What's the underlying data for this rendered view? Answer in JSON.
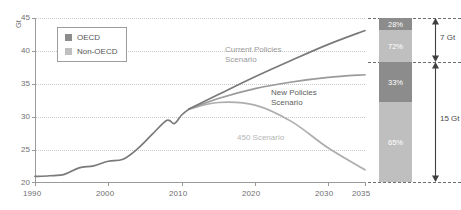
{
  "chart_data": {
    "type": "line",
    "title": "",
    "xlabel": "",
    "ylabel": "Gt",
    "yunit": "Gt",
    "xlim": [
      1990,
      2035
    ],
    "ylim": [
      20,
      45
    ],
    "grid": true,
    "xticks": [
      "1990",
      "2000",
      "2010",
      "2020",
      "2030",
      "2035"
    ],
    "xtick_values": [
      1990,
      2000,
      2010,
      2020,
      2030,
      2035
    ],
    "yticks": [
      "20",
      "25",
      "30",
      "35",
      "40",
      "45"
    ],
    "ytick_values": [
      20,
      25,
      30,
      35,
      40,
      45
    ],
    "legend": {
      "position": "top-left",
      "entries": [
        {
          "label": "OECD",
          "color": "#8c8c8c"
        },
        {
          "label": "Non-OECD",
          "color": "#bfbfbf"
        }
      ]
    },
    "series": [
      {
        "name": "Historical",
        "color": "#7a7a7a",
        "x": [
          1990,
          1992,
          1994,
          1996,
          1998,
          2000,
          2002,
          2004,
          2006,
          2008,
          2009,
          2010,
          2011
        ],
        "values": [
          21.0,
          21.1,
          21.3,
          22.3,
          22.6,
          23.3,
          23.6,
          25.2,
          27.4,
          29.5,
          29.0,
          30.3,
          31.2
        ]
      },
      {
        "name": "Current Policies Scenario",
        "color": "#7a7a7a",
        "x": [
          2011,
          2015,
          2020,
          2025,
          2030,
          2035
        ],
        "values": [
          31.2,
          33.4,
          36.1,
          38.6,
          41.0,
          43.1
        ]
      },
      {
        "name": "New Policies Scenario",
        "color": "#9a9a9a",
        "x": [
          2011,
          2015,
          2020,
          2025,
          2030,
          2035
        ],
        "values": [
          31.2,
          32.8,
          34.3,
          35.3,
          36.0,
          36.4
        ]
      },
      {
        "name": "450 Scenario",
        "color": "#adadad",
        "x": [
          2011,
          2015,
          2020,
          2025,
          2030,
          2035
        ],
        "values": [
          31.2,
          32.2,
          31.8,
          29.3,
          25.3,
          22.0
        ]
      }
    ],
    "annotations": [
      {
        "text": "Current Policies",
        "text2": "Scenario",
        "color": "#9a9a9a"
      },
      {
        "text": "New Policies",
        "text2": "Scenario",
        "color": "#5e5e5e"
      },
      {
        "text": "450 Scenario",
        "text2": "",
        "color": "#b5b5b5"
      }
    ],
    "side_bars": {
      "bars": [
        {
          "name": "upper-gap-bar",
          "total_label": "7 Gt",
          "total_value": 7,
          "segments": [
            {
              "label": "28%",
              "value": 28,
              "series": "OECD",
              "color": "#8c8c8c"
            },
            {
              "label": "72%",
              "value": 72,
              "series": "Non-OECD",
              "color": "#bfbfbf"
            }
          ]
        },
        {
          "name": "lower-gap-bar",
          "total_label": "15 Gt",
          "total_value": 15,
          "segments": [
            {
              "label": "33%",
              "value": 33,
              "series": "OECD",
              "color": "#8c8c8c"
            },
            {
              "label": "65%",
              "value": 65,
              "series": "Non-OECD",
              "color": "#bfbfbf"
            }
          ]
        }
      ]
    }
  }
}
